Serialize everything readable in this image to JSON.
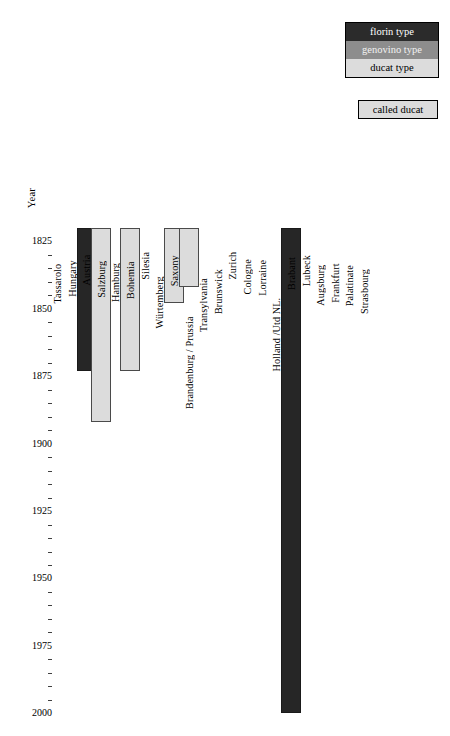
{
  "legend": {
    "items": [
      {
        "label": "florin type",
        "key": "florin",
        "color": "#2b2b2b"
      },
      {
        "label": "genovino type",
        "key": "genovino",
        "color": "#8d8d8d"
      },
      {
        "label": "ducat type",
        "key": "ducat",
        "color": "#dcdcdc"
      }
    ],
    "called": {
      "label": "called ducat",
      "color": "#dcdcdc"
    }
  },
  "chart_data": {
    "type": "bar",
    "orientation": "vertical-timeline",
    "title": "",
    "xlabel": "",
    "ylabel": "Year",
    "ylim": [
      1820,
      2000
    ],
    "grid": false,
    "legend_position": "top-right",
    "ytick_major": [
      1825,
      1850,
      1875,
      1900,
      1925,
      1950,
      1975,
      2000
    ],
    "ytick_minor_step": 5,
    "categories": [
      "Tassarolo",
      "Hungary",
      "Austria",
      "Salzburg",
      "Hamburg",
      "Bohemia",
      "Silesia",
      "Würtemberg",
      "Saxony",
      "Brandenburg / Prussia",
      "Transylvania",
      "Brunswick",
      "Zurich",
      "Cologne",
      "Lorraine",
      "Holland /Utd NL.",
      "Brabant",
      "Lubeck",
      "Augsburg",
      "Frankfurt",
      "Palatinate",
      "Strasbourg"
    ],
    "series": [
      {
        "name": "Tassarolo",
        "type": null,
        "start": null,
        "end": null
      },
      {
        "name": "Hungary",
        "type": "florin",
        "start": 1820,
        "end": 1873
      },
      {
        "name": "Austria",
        "type": "ducat",
        "start": 1820,
        "end": 1892
      },
      {
        "name": "Salzburg",
        "type": null,
        "start": null,
        "end": null
      },
      {
        "name": "Hamburg",
        "type": "ducat",
        "start": 1820,
        "end": 1873
      },
      {
        "name": "Bohemia",
        "type": null,
        "start": null,
        "end": null
      },
      {
        "name": "Silesia",
        "type": null,
        "start": null,
        "end": null
      },
      {
        "name": "Würtemberg",
        "type": "ducat",
        "start": 1820,
        "end": 1848
      },
      {
        "name": "Saxony",
        "type": "ducat",
        "start": 1820,
        "end": 1842
      },
      {
        "name": "Brandenburg / Prussia",
        "type": null,
        "start": null,
        "end": null
      },
      {
        "name": "Transylvania",
        "type": null,
        "start": null,
        "end": null
      },
      {
        "name": "Brunswick",
        "type": null,
        "start": null,
        "end": null
      },
      {
        "name": "Zurich",
        "type": null,
        "start": null,
        "end": null
      },
      {
        "name": "Cologne",
        "type": null,
        "start": null,
        "end": null
      },
      {
        "name": "Lorraine",
        "type": null,
        "start": null,
        "end": null
      },
      {
        "name": "Holland /Utd NL.",
        "type": "florin",
        "start": 1820,
        "end": 2000
      },
      {
        "name": "Brabant",
        "type": null,
        "start": null,
        "end": null
      },
      {
        "name": "Lubeck",
        "type": null,
        "start": null,
        "end": null
      },
      {
        "name": "Augsburg",
        "type": null,
        "start": null,
        "end": null
      },
      {
        "name": "Frankfurt",
        "type": null,
        "start": null,
        "end": null
      },
      {
        "name": "Palatinate",
        "type": null,
        "start": null,
        "end": null
      },
      {
        "name": "Strasbourg",
        "type": null,
        "start": null,
        "end": null
      }
    ]
  },
  "layout": {
    "year_axis_title": "Year",
    "plot_top_px": 228,
    "plot_bottom_px": 716,
    "year_top": 1820,
    "year_bottom": 2001,
    "label_baseline_px": 224,
    "col_first_x": 62,
    "col_step": 14.62,
    "bar_width": 20
  }
}
